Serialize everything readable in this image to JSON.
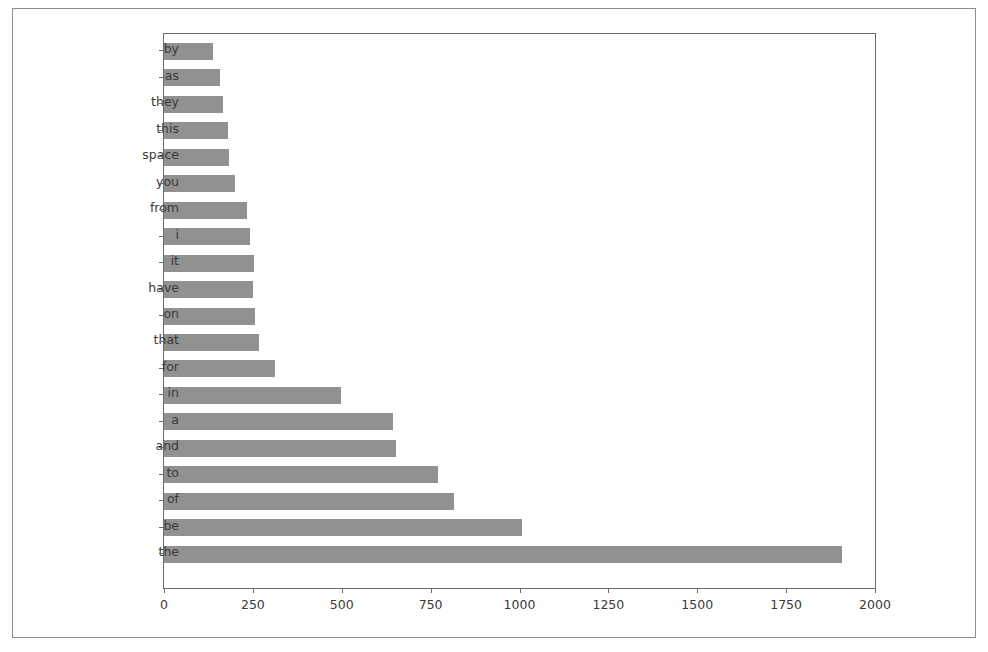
{
  "figure": {
    "background_color": "#ffffff",
    "frame_color": "#8d8d8d",
    "axes_border_color": "#6b6b6b",
    "bar_color": "#919191",
    "tick_text_color": "#3a3a3a"
  },
  "chart_data": {
    "type": "bar",
    "orientation": "horizontal",
    "title": "",
    "xlabel": "",
    "ylabel": "",
    "xlim": [
      0,
      2000
    ],
    "ylim_categories": 21,
    "grid": false,
    "legend": null,
    "xticks": [
      0,
      250,
      500,
      750,
      1000,
      1250,
      1500,
      1750,
      2000
    ],
    "xtick_labels": [
      "0",
      "250",
      "500",
      "750",
      "1000",
      "1250",
      "1500",
      "1750",
      "2000"
    ],
    "categories": [
      "by",
      "as",
      "they",
      "this",
      "space",
      "you",
      "from",
      "i",
      "it",
      "have",
      "on",
      "that",
      "for",
      "in",
      "a",
      "and",
      "to",
      "of",
      "be",
      "the"
    ],
    "values": [
      137,
      157,
      167,
      181,
      183,
      200,
      233,
      242,
      252,
      250,
      257,
      266,
      312,
      497,
      645,
      652,
      772,
      816,
      1006,
      1907
    ],
    "bar_color": "#919191",
    "series": [
      {
        "name": "word frequency",
        "values": [
          137,
          157,
          167,
          181,
          183,
          200,
          233,
          242,
          252,
          250,
          257,
          266,
          312,
          497,
          645,
          652,
          772,
          816,
          1006,
          1907
        ]
      }
    ]
  }
}
